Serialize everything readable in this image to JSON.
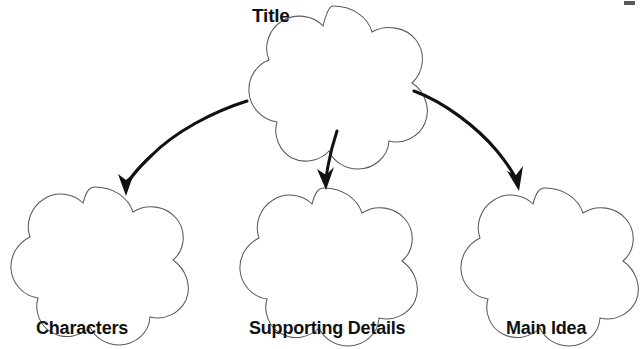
{
  "document": {
    "type": "graphic-organizer",
    "title_label": "Title",
    "background_color": "#ffffff",
    "outline_color": "#5a5a5a",
    "arrow_color": "#111111",
    "text_color": "#111111"
  },
  "diagram": {
    "root": {
      "label": "Title",
      "shape": "five-lobed-flower",
      "center_x": 333,
      "center_y": 71
    },
    "children": [
      {
        "label": "Characters",
        "shape": "five-lobed-flower",
        "center_x": 95,
        "center_y": 251
      },
      {
        "label": "Supporting Details",
        "shape": "five-lobed-flower",
        "center_x": 324,
        "center_y": 252
      },
      {
        "label": "Main Idea",
        "shape": "five-lobed-flower",
        "center_x": 545,
        "center_y": 252
      }
    ],
    "connectors": [
      {
        "name": "arrow-to-characters",
        "from": "Title",
        "to": "Characters",
        "style": "curved-arrow"
      },
      {
        "name": "arrow-to-supporting-details",
        "from": "Title",
        "to": "Supporting Details",
        "style": "curved-arrow"
      },
      {
        "name": "arrow-to-main-idea",
        "from": "Title",
        "to": "Main Idea",
        "style": "curved-arrow"
      }
    ]
  }
}
